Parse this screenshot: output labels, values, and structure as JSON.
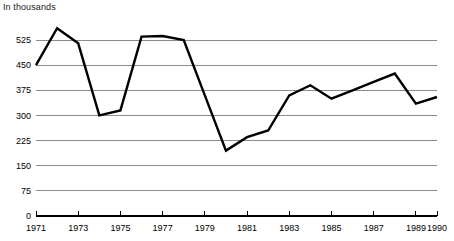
{
  "chart_data": {
    "type": "line",
    "title": "In thousands",
    "xlabel": "",
    "ylabel": "",
    "xlim": [
      1971,
      1990
    ],
    "ylim": [
      0,
      600
    ],
    "grid": true,
    "legend": false,
    "yticks": [
      0,
      75,
      150,
      225,
      300,
      375,
      450,
      525
    ],
    "ytick_labels": [
      "0",
      "75",
      "150",
      "225",
      "300",
      "375",
      "450",
      "525"
    ],
    "xticks": [
      1971,
      1973,
      1975,
      1977,
      1979,
      1981,
      1983,
      1985,
      1987,
      1989,
      1990
    ],
    "xtick_labels": [
      "1971",
      "1973",
      "1975",
      "1977",
      "1979",
      "1981",
      "1983",
      "1985",
      "1987",
      "1989",
      "1990"
    ],
    "x": [
      1971,
      1972,
      1973,
      1974,
      1975,
      1976,
      1977,
      1978,
      1979,
      1980,
      1981,
      1982,
      1983,
      1984,
      1985,
      1986,
      1987,
      1988,
      1989,
      1990
    ],
    "values": [
      450,
      560,
      515,
      300,
      315,
      535,
      537,
      525,
      360,
      195,
      235,
      255,
      360,
      390,
      350,
      375,
      400,
      425,
      335,
      355
    ],
    "series": [
      {
        "name": "",
        "values": [
          450,
          560,
          515,
          300,
          315,
          535,
          537,
          525,
          360,
          195,
          235,
          255,
          360,
          390,
          350,
          375,
          400,
          425,
          335,
          355
        ]
      }
    ]
  }
}
